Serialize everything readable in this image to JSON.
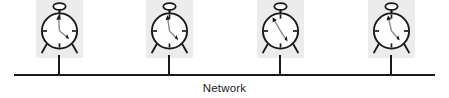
{
  "diagram": {
    "type": "network-bus-with-clocks",
    "background_color": "#ffffff",
    "line_color": "#1a1a1a",
    "node_box_color": "#ececec",
    "bus": {
      "label": "Network",
      "label_color": "#1d1d1d",
      "line_x_start": 14,
      "line_x_end": 435,
      "line_y": 74,
      "line_thickness": 2
    },
    "nodes": [
      {
        "id": "node-1",
        "icon": "alarm-clock-icon",
        "box_x": 36,
        "box_y": 0,
        "stem_x": 59,
        "hour_hand_angle_deg": 356,
        "minute_hand_angle_deg": 130
      },
      {
        "id": "node-2",
        "icon": "alarm-clock-icon",
        "box_x": 146,
        "box_y": 0,
        "stem_x": 169,
        "hour_hand_angle_deg": 352,
        "minute_hand_angle_deg": 137
      },
      {
        "id": "node-3",
        "icon": "alarm-clock-icon",
        "box_x": 257,
        "box_y": 0,
        "stem_x": 280,
        "hour_hand_angle_deg": 330,
        "minute_hand_angle_deg": 147
      },
      {
        "id": "node-4",
        "icon": "alarm-clock-icon",
        "box_x": 368,
        "box_y": 0,
        "stem_x": 391,
        "hour_hand_angle_deg": 347,
        "minute_hand_angle_deg": 140
      }
    ]
  }
}
